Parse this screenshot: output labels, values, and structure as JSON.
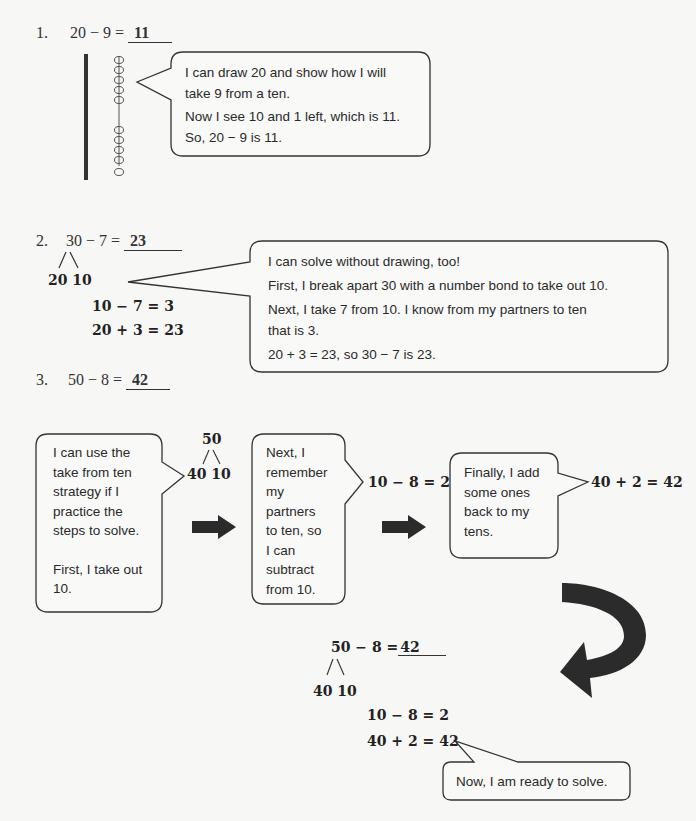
{
  "problems": [
    {
      "number": "1.",
      "equation": "20 − 9 =",
      "answer": "11",
      "bubble": {
        "lines": [
          "I can draw 20 and show how I will",
          "take 9 from a ten.",
          "Now I see 10 and 1 left, which is 11.",
          "So, 20 − 9 is 11."
        ]
      },
      "drawing": {
        "tens_sticks": 1,
        "ones_circles": 10,
        "crossed_out": 9
      }
    },
    {
      "number": "2.",
      "equation": "30 − 7 =",
      "answer": "23",
      "bond": {
        "left": "20",
        "right": "10"
      },
      "steps": [
        "10 − 7 = 3",
        "20 + 3 = 23"
      ],
      "bubble": {
        "lines": [
          "I can solve without drawing, too!",
          "First, I break apart 30 with a number bond to take out 10.",
          "Next, I take 7 from 10.  I know from my partners to ten",
          "that is 3.",
          "20 + 3 = 23, so 30 − 7 is 23."
        ]
      }
    },
    {
      "number": "3.",
      "equation": "50 − 8 =",
      "answer": "42",
      "flow": {
        "bubble1": [
          "I can use the",
          "take from ten",
          "strategy if I",
          "practice the",
          "steps to solve.",
          "",
          "First, I take out",
          "10."
        ],
        "bond": {
          "top": "50",
          "left": "40",
          "right": "10"
        },
        "bubble2": [
          "Next, I",
          "remember",
          "my",
          "partners",
          "to ten, so",
          "I can",
          "subtract",
          "from 10."
        ],
        "step1": "10 − 8 = 2",
        "bubble3": [
          "Finally, I add",
          "some ones",
          "back to my",
          "tens."
        ],
        "step2": "40 + 2 = 42"
      },
      "summary": {
        "equation": "50 − 8 =",
        "answer": "42",
        "bond": {
          "left": "40",
          "right": "10"
        },
        "steps": [
          "10 − 8 = 2",
          "40 + 2 = 42"
        ],
        "bubble": "Now, I am ready to solve."
      }
    }
  ],
  "icons": {
    "arrow": "right-arrow-icon",
    "curved_arrow": "curved-arrow-icon"
  },
  "colors": {
    "ink": "#222222",
    "arrow": "#2b2b2b",
    "background": "#f7f7f6"
  }
}
